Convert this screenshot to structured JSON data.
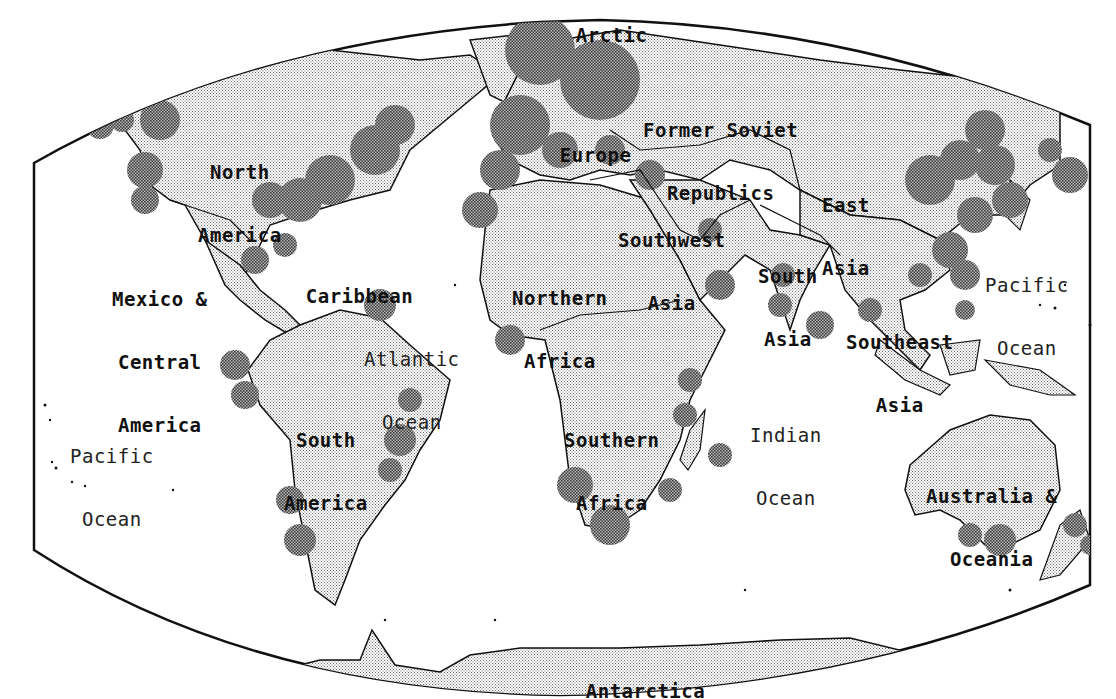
{
  "map": {
    "style": "halftone world map",
    "colors": {
      "background": "#ffffff",
      "land_pattern": "#8a8a8a",
      "highlight_pattern": "#555555",
      "outline": "#111111",
      "text": "#111111"
    }
  },
  "regions": [
    {
      "id": "arctic",
      "label": "Arctic"
    },
    {
      "id": "former-soviet-republics",
      "line1": "Former Soviet",
      "line2": "Republics"
    },
    {
      "id": "north-america",
      "line1": "North",
      "line2": "America"
    },
    {
      "id": "europe",
      "label": "Europe"
    },
    {
      "id": "east-asia",
      "line1": "East",
      "line2": "Asia"
    },
    {
      "id": "southwest-asia",
      "line1": "Southwest",
      "line2": "Asia"
    },
    {
      "id": "south-asia",
      "line1": "South",
      "line2": "Asia"
    },
    {
      "id": "mexico-central-america",
      "line1": "Mexico &",
      "line2": "Central",
      "line3": "America"
    },
    {
      "id": "caribbean",
      "label": "Caribbean"
    },
    {
      "id": "northern-africa",
      "line1": "Northern",
      "line2": "Africa"
    },
    {
      "id": "southeast-asia",
      "line1": "Southeast",
      "line2": "Asia"
    },
    {
      "id": "south-america",
      "line1": "South",
      "line2": "America"
    },
    {
      "id": "southern-africa",
      "line1": "Southern",
      "line2": "Africa"
    },
    {
      "id": "australia-oceania",
      "line1": "Australia &",
      "line2": "Oceania"
    },
    {
      "id": "antarctica",
      "label": "Antarctica"
    }
  ],
  "oceans": [
    {
      "id": "atlantic-ocean",
      "line1": "Atlantic",
      "line2": "Ocean"
    },
    {
      "id": "indian-ocean",
      "line1": "Indian",
      "line2": "Ocean"
    },
    {
      "id": "pacific-ocean-west",
      "line1": "Pacific",
      "line2": "Ocean"
    },
    {
      "id": "pacific-ocean-east",
      "line1": "Pacific",
      "line2": "Ocean"
    }
  ]
}
